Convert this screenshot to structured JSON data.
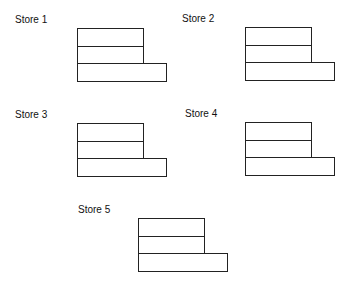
{
  "stores": [
    {
      "title": "Store 1",
      "rows": [
        {
          "label": "employees"
        },
        {
          "label": "registers"
        },
        {
          "label": "sales"
        }
      ]
    },
    {
      "title": "Store 2",
      "rows": [
        {
          "label": "employees"
        },
        {
          "label": "registers"
        },
        {
          "label": "sales"
        }
      ]
    },
    {
      "title": "Store 3",
      "rows": [
        {
          "label": "employees"
        },
        {
          "label": "registers"
        },
        {
          "label": "sales"
        }
      ]
    },
    {
      "title": "Store 4",
      "rows": [
        {
          "label": "employees"
        },
        {
          "label": "registers"
        },
        {
          "label": "sales"
        }
      ]
    },
    {
      "title": "Store 5",
      "rows": [
        {
          "label": "employees"
        },
        {
          "label": "registers"
        },
        {
          "label": "sales"
        }
      ]
    }
  ],
  "colors": {
    "stroke": "#222222",
    "text": "#111111",
    "background": "#ffffff"
  }
}
